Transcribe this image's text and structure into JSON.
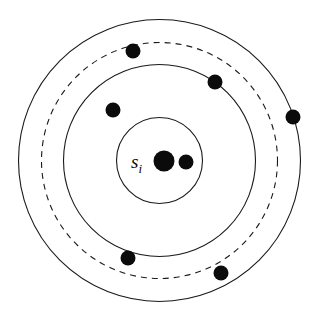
{
  "figure": {
    "name": "concentric-neighborhood-diagram",
    "background_color": "#ffffff",
    "stroke_color": "#1a1a1a",
    "dot_color": "#0b0b0b",
    "width": 324,
    "height": 326
  },
  "center": {
    "label_main": "s",
    "label_sub": "i",
    "label_text": "s_i",
    "x": 159.5,
    "y": 160.5,
    "label_x": 131,
    "label_y": 168
  },
  "circles": [
    {
      "id": "inner-circle",
      "name": "inner-solid-circle",
      "style": "solid",
      "radius": 43,
      "cx": 159.5,
      "cy": 160.5
    },
    {
      "id": "middle-circle",
      "name": "middle-solid-circle",
      "style": "solid",
      "radius": 96,
      "cx": 159.5,
      "cy": 160.5
    },
    {
      "id": "dashed-circle",
      "name": "dashed-threshold-circle",
      "style": "dashed",
      "radius": 118,
      "cx": 159.5,
      "cy": 160.5
    },
    {
      "id": "outer-circle",
      "name": "outer-solid-circle",
      "style": "solid",
      "radius": 141,
      "cx": 159.5,
      "cy": 160.5
    }
  ],
  "dots": [
    {
      "id": "center-primary-dot",
      "name": "center-primary-dot",
      "cx": 164,
      "cy": 161,
      "r": 10.5
    },
    {
      "id": "center-secondary-dot",
      "name": "center-secondary-dot",
      "cx": 186,
      "cy": 162,
      "r": 7.5
    },
    {
      "id": "dot-top",
      "name": "point-top",
      "cx": 133,
      "cy": 51,
      "r": 7.5
    },
    {
      "id": "dot-upper-right",
      "name": "point-upper-right",
      "cx": 215,
      "cy": 82,
      "r": 7.5
    },
    {
      "id": "dot-far-right",
      "name": "point-far-right",
      "cx": 293,
      "cy": 117,
      "r": 7.5
    },
    {
      "id": "dot-mid-left",
      "name": "point-mid-left",
      "cx": 113,
      "cy": 110,
      "r": 7.5
    },
    {
      "id": "dot-lower-left",
      "name": "point-lower-left",
      "cx": 128,
      "cy": 258,
      "r": 7.5
    },
    {
      "id": "dot-lower-right",
      "name": "point-lower-right",
      "cx": 221,
      "cy": 273,
      "r": 7.5
    }
  ],
  "chart_data": {
    "type": "scatter",
    "title": "",
    "subtitle": "",
    "xlabel": "",
    "ylabel": "",
    "grid": false,
    "legend_position": "none",
    "center_point": {
      "label": "s_i",
      "x": 159.5,
      "y": 160.5
    },
    "ring_radii": [
      43,
      96,
      118,
      141
    ],
    "ring_styles": [
      "solid",
      "solid",
      "dashed",
      "solid"
    ],
    "points": [
      {
        "label": "center-primary",
        "x": 164,
        "y": 161,
        "radius_from_center": 4.5,
        "inside_ring": "inner"
      },
      {
        "label": "center-secondary",
        "x": 186,
        "y": 162,
        "radius_from_center": 26.5,
        "inside_ring": "inner"
      },
      {
        "label": "mid-left",
        "x": 113,
        "y": 110,
        "radius_from_center": 69.0,
        "inside_ring": "middle"
      },
      {
        "label": "top",
        "x": 133,
        "y": 51,
        "radius_from_center": 112.6,
        "inside_ring": "dashed"
      },
      {
        "label": "upper-right",
        "x": 215,
        "y": 82,
        "radius_from_center": 96.3,
        "inside_ring": "middle"
      },
      {
        "label": "lower-left",
        "x": 128,
        "y": 258,
        "radius_from_center": 102.3,
        "inside_ring": "dashed"
      },
      {
        "label": "lower-right",
        "x": 221,
        "y": 273,
        "radius_from_center": 128.6,
        "inside_ring": "outer"
      },
      {
        "label": "far-right",
        "x": 293,
        "y": 117,
        "radius_from_center": 140.3,
        "inside_ring": "outer"
      }
    ],
    "xlim": [
      0,
      324
    ],
    "ylim": [
      0,
      326
    ]
  }
}
